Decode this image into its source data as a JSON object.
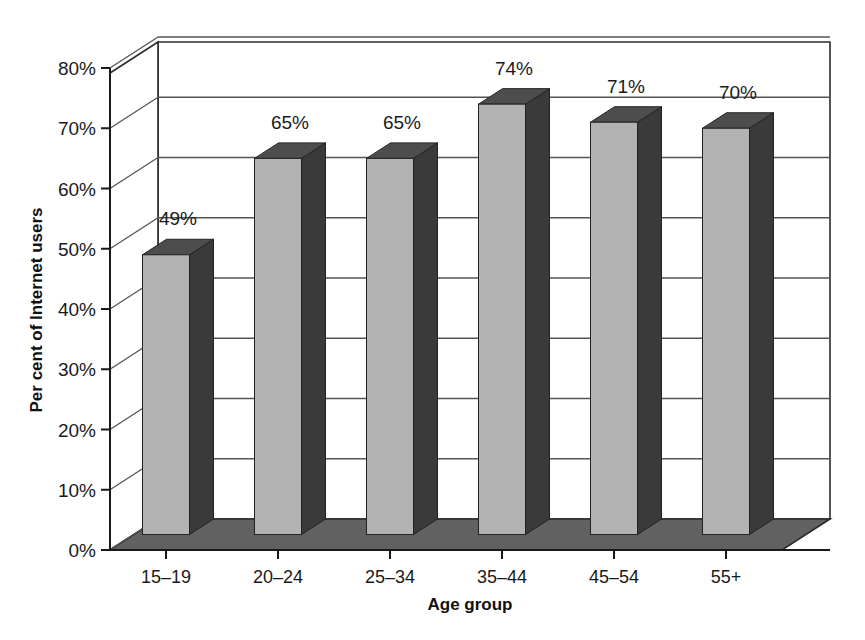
{
  "chart_data": {
    "type": "bar",
    "title": "",
    "subtitle": "",
    "xlabel": "Age group",
    "ylabel": "Per cent of Internet users",
    "categories": [
      "15–19",
      "20–24",
      "25–34",
      "35–44",
      "45–54",
      "55+"
    ],
    "values": [
      49,
      65,
      65,
      74,
      71,
      70
    ],
    "data_labels": [
      "49%",
      "65%",
      "65%",
      "74%",
      "71%",
      "70%"
    ],
    "ylim": [
      0,
      80
    ],
    "ytick_values": [
      0,
      10,
      20,
      30,
      40,
      50,
      60,
      70,
      80
    ],
    "ytick_labels": [
      "0%",
      "10%",
      "20%",
      "30%",
      "40%",
      "50%",
      "60%",
      "70%",
      "80%"
    ],
    "grid": true,
    "grid_axis": "y",
    "legend": false,
    "legend_position": "none",
    "style": "3d-column",
    "annotations": []
  },
  "colors": {
    "bar_front": "#b2b2b2",
    "bar_side": "#3a3a3a",
    "bar_top": "#4d4d4d",
    "floor": "#616161",
    "wall": "#ffffff",
    "gridline": "#555555",
    "axis": "#1a1a1a",
    "background": "#ffffff",
    "text": "#1a1a1a"
  }
}
